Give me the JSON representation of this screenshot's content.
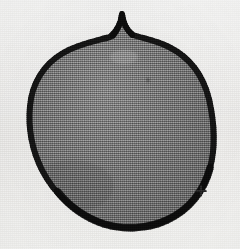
{
  "image": {
    "kind": "scanned-halftone-illustration",
    "subject_label": "nut specimen outline",
    "width": 240,
    "height": 249,
    "background_color": "#faf9f7",
    "alt_text": "Scanned halftone illustration of a rounded nut with a pointed apex, drawn with a thick black outline and mid-gray stippled interior, with a small registration cross at lower right."
  },
  "specimen": {
    "name": "nut-specimen",
    "outline_color": "#121212",
    "fill_color": "#787878",
    "fill_color_dark": "#6a6a6a",
    "fill_color_light": "#8a8a8a",
    "outline_width_px": 6,
    "apex": {
      "x": 122,
      "y": 14,
      "label": "apex-cusp"
    },
    "bounds": {
      "left": 28,
      "right": 213,
      "top": 14,
      "bottom": 229
    },
    "path": "M122,14 C121,24 117,31 110,37 C96,41 78,44 63,53 C44,64 32,83 30,106 C28,127 32,150 42,170 C54,194 77,215 104,224 C124,230 148,229 167,220 C189,210 204,191 210,168 C216,146 214,121 209,99 C203,75 189,57 169,47 C155,40 141,38 133,35 C126,30 123,22 122,14 Z"
  },
  "marks": [
    {
      "name": "registration-cross",
      "glyph": "plus",
      "x": 201,
      "y": 191,
      "size": 11,
      "color": "#2a2a2a"
    },
    {
      "name": "interior-speck",
      "glyph": "dot",
      "x": 148,
      "y": 80,
      "size": 3,
      "color": "#3d3d3d"
    },
    {
      "name": "interior-highlight-smudge",
      "glyph": "smudge",
      "x": 124,
      "y": 57,
      "size": 14,
      "color": "#9a9a9a"
    }
  ]
}
